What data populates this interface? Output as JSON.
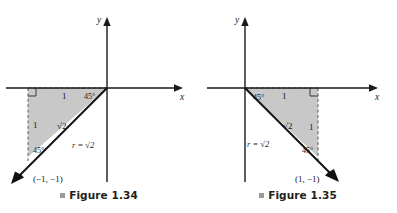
{
  "document": {
    "background_color": "#ffffff",
    "width": 397,
    "height": 213
  },
  "figures": [
    {
      "id": "figure-1-34",
      "caption": "Figure 1.34",
      "caption_bullet_color": "#9a9a9a",
      "axis_labels": {
        "x": "x",
        "y": "y"
      },
      "shade_color": "#c8c8c8",
      "point_label": "(−1, −1)",
      "ray_label": "r = √2",
      "hypotenuse_label": "√2",
      "leg_top_label": "1",
      "leg_side_label": "1",
      "angle_at_origin": "45°",
      "angle_at_point": "45°",
      "quadrant": "third",
      "terminal_point": {
        "x": -1,
        "y": -1
      },
      "r_value": "√2",
      "theta_degrees": 225
    },
    {
      "id": "figure-1-35",
      "caption": "Figure 1.35",
      "caption_bullet_color": "#9a9a9a",
      "axis_labels": {
        "x": "x",
        "y": "y"
      },
      "shade_color": "#c8c8c8",
      "point_label": "(1, −1)",
      "ray_label": "r = √2",
      "hypotenuse_label": "√2",
      "leg_top_label": "1",
      "leg_side_label": "1",
      "angle_at_origin": "45°",
      "angle_at_point": "45°",
      "quadrant": "fourth",
      "terminal_point": {
        "x": 1,
        "y": -1
      },
      "r_value": "√2",
      "theta_degrees": -45
    }
  ]
}
